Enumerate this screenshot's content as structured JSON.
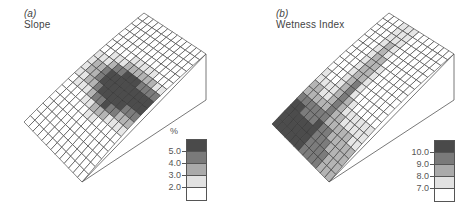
{
  "panels": [
    {
      "id": "a",
      "label": "(a)",
      "title": "Slope",
      "legend": {
        "unit": "%",
        "ticks": [
          "5.0",
          "4.0",
          "3.0",
          "2.0"
        ],
        "colors": [
          "#4a4a4a",
          "#7a7a7a",
          "#aaaaaa",
          "#e2e2e2",
          "#ffffff"
        ]
      }
    },
    {
      "id": "b",
      "label": "(b)",
      "title": "Wetness Index",
      "legend": {
        "unit": "",
        "ticks": [
          "10.0",
          "9.0",
          "8.0",
          "7.0"
        ],
        "colors": [
          "#4a4a4a",
          "#7a7a7a",
          "#aaaaaa",
          "#e2e2e2",
          "#ffffff"
        ]
      }
    }
  ],
  "chart_data": [
    {
      "type": "heatmap",
      "title": "(a) Slope",
      "description": "3D wireframe terrain surface (hillslope) shaded by slope class",
      "legend_title": "%",
      "classes": [
        "<2.0",
        "2.0-3.0",
        "3.0-4.0",
        "4.0-5.0",
        ">5.0"
      ],
      "tick_labels": [
        "2.0",
        "3.0",
        "4.0",
        "5.0"
      ],
      "grid": "approx 14 x 20 cells",
      "notes": "Steepest slopes (>5%) concentrated in mid-slope band and upper hollow; lowlands near outlet and crest are gentle (<2%)"
    },
    {
      "type": "heatmap",
      "title": "(b) Wetness Index",
      "description": "3D wireframe terrain surface shaded by topographic wetness index class",
      "legend_title": "",
      "classes": [
        "<7.0",
        "7.0-8.0",
        "8.0-9.0",
        "9.0-10.0",
        ">10.0"
      ],
      "tick_labels": [
        "7.0",
        "8.0",
        "9.0",
        "10.0"
      ],
      "grid": "approx 14 x 20 cells",
      "notes": "Highest wetness (>10) in lower-left valley bottom and along central drainage hollow; upper slopes and ridges are dry (<7)"
    }
  ]
}
